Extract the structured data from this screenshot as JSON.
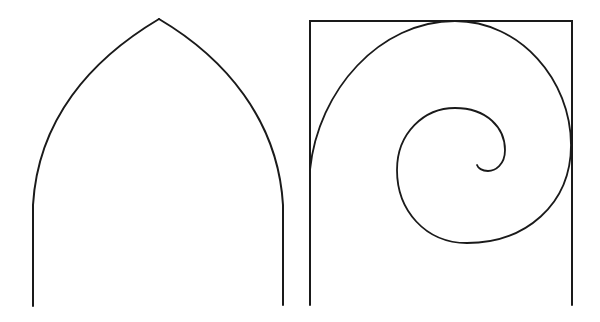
{
  "figure": {
    "description": "Line drawing: pointed Gothic arch beside a spiral inscribed in a square frame",
    "background": "#ffffff",
    "stroke_color": "#1a1a1a",
    "stroke_width": 2
  },
  "arch": {
    "label": "Pointed (Gothic) arch",
    "apex": [
      159,
      19
    ],
    "left_leg": {
      "top": [
        33,
        205
      ],
      "bottom": [
        33,
        306
      ]
    },
    "right_leg": {
      "top": [
        283,
        205
      ],
      "bottom": [
        283,
        305
      ]
    }
  },
  "spiral_frame": {
    "label": "Spiral inscribed in square frame",
    "frame": {
      "left": 310,
      "right": 572,
      "top": 21,
      "bottom": 305
    },
    "spiral_tangent_points": {
      "left": [
        310,
        170
      ],
      "top": [
        455,
        21
      ],
      "right": [
        571,
        145
      ]
    },
    "spiral_end": [
      477,
      165
    ]
  }
}
